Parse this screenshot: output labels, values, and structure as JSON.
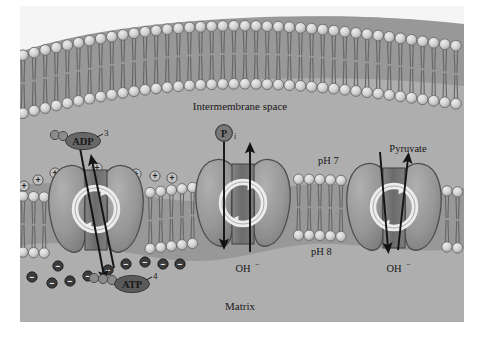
{
  "figure": {
    "compartments": {
      "intermembrane_space_label": "Intermembrane space",
      "matrix_label": "Matrix",
      "ph_outer_label": "pH 7",
      "ph_inner_label": "pH 8"
    },
    "transporters": [
      {
        "id": "adenine-nucleotide-translocase",
        "substrate_out_label": "ATP",
        "substrate_out_charge": "4",
        "substrate_in_label": "ADP",
        "substrate_in_charge": "3",
        "adp_phosphate_count": 2,
        "atp_phosphate_count": 3
      },
      {
        "id": "phosphate-translocase",
        "substrate_in_label": "P",
        "substrate_in_subscript": "i",
        "substrate_out_label": "OH",
        "substrate_out_charge": "−"
      },
      {
        "id": "pyruvate-translocase",
        "substrate_in_label": "Pyruvate",
        "substrate_out_label": "OH",
        "substrate_out_charge": "−"
      }
    ],
    "charges": {
      "positive_symbol": "+",
      "negative_symbol": "−",
      "positive_count": 9,
      "negative_count": 10,
      "positive_side": "intermembrane space",
      "negative_side": "matrix"
    },
    "colors": {
      "background": "#ffffff",
      "cytosol_fill": "#b3b3b3",
      "lipid_head": "#d8d8d8",
      "lipid_head_stroke": "#6e6e6e",
      "lipid_tail": "#8c8c8c",
      "protein_fill": "#9a9a9a",
      "protein_stroke": "#4d4d4d",
      "channel_fill": "#787878",
      "ring_fill": "#f2f2f2",
      "ring_stroke": "#555555",
      "arrow": "#141414",
      "label_text": "#1a1a1a",
      "badge_fill": "#6a6a6a",
      "badge_text": "#ffffff"
    }
  }
}
